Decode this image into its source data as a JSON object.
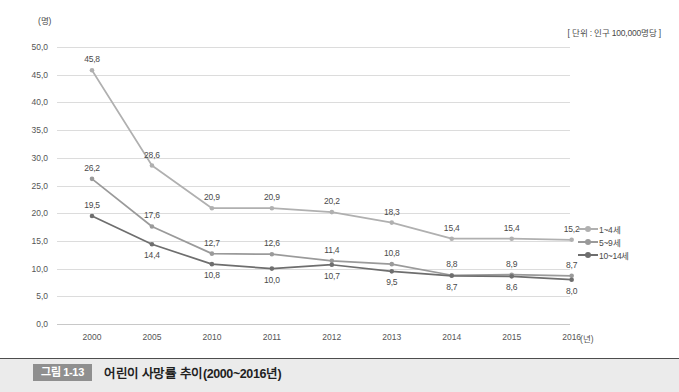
{
  "chart_data": {
    "type": "line",
    "title": "어린이 사망률 추이(2000~2016년)",
    "unit_note": "[ 단위 : 인구 100,000명당 ]",
    "ylabel": "(명)",
    "xlabel": "(년)",
    "categories": [
      "2000",
      "2005",
      "2010",
      "2011",
      "2012",
      "2013",
      "2014",
      "2015",
      "2016"
    ],
    "ylim": [
      0.0,
      50.0
    ],
    "ytick_step": 5.0,
    "ytick_labels": [
      "0,0",
      "5,0",
      "10,0",
      "15,0",
      "20,0",
      "25,0",
      "30,0",
      "35,0",
      "40,0",
      "45,0",
      "50,0"
    ],
    "grid": true,
    "legend_position": "right",
    "series": [
      {
        "name": "1~4세",
        "color": "#b0b0b0",
        "values": [
          45.8,
          28.6,
          20.9,
          20.9,
          20.2,
          18.3,
          15.4,
          15.4,
          15.2
        ],
        "value_labels": [
          "45,8",
          "28,6",
          "20,9",
          "20,9",
          "20,2",
          "18,3",
          "15,4",
          "15,4",
          "15,2"
        ],
        "label_side": [
          "above",
          "above",
          "above",
          "above",
          "above",
          "above",
          "above",
          "above",
          "above"
        ]
      },
      {
        "name": "5~9세",
        "color": "#9a9a9a",
        "values": [
          26.2,
          17.6,
          12.7,
          12.6,
          11.4,
          10.8,
          8.8,
          8.9,
          8.7
        ],
        "value_labels": [
          "26,2",
          "17,6",
          "12,7",
          "12,6",
          "11,4",
          "10,8",
          "8,8",
          "8,9",
          "8,7"
        ],
        "label_side": [
          "above",
          "above",
          "above",
          "above",
          "above",
          "above",
          "above",
          "above",
          "above"
        ]
      },
      {
        "name": "10~14세",
        "color": "#6e6e6e",
        "values": [
          19.5,
          14.4,
          10.8,
          10.0,
          10.7,
          9.5,
          8.7,
          8.6,
          8.0
        ],
        "value_labels": [
          "19,5",
          "14,4",
          "10,8",
          "10,0",
          "10,7",
          "9,5",
          "8,7",
          "8,6",
          "8,0"
        ],
        "label_side": [
          "above",
          "below",
          "below",
          "below",
          "below",
          "below",
          "below",
          "below",
          "below"
        ]
      }
    ]
  },
  "caption": {
    "badge": "그림 1-13",
    "title": "어린이 사망률 추이(2000~2016년)"
  }
}
